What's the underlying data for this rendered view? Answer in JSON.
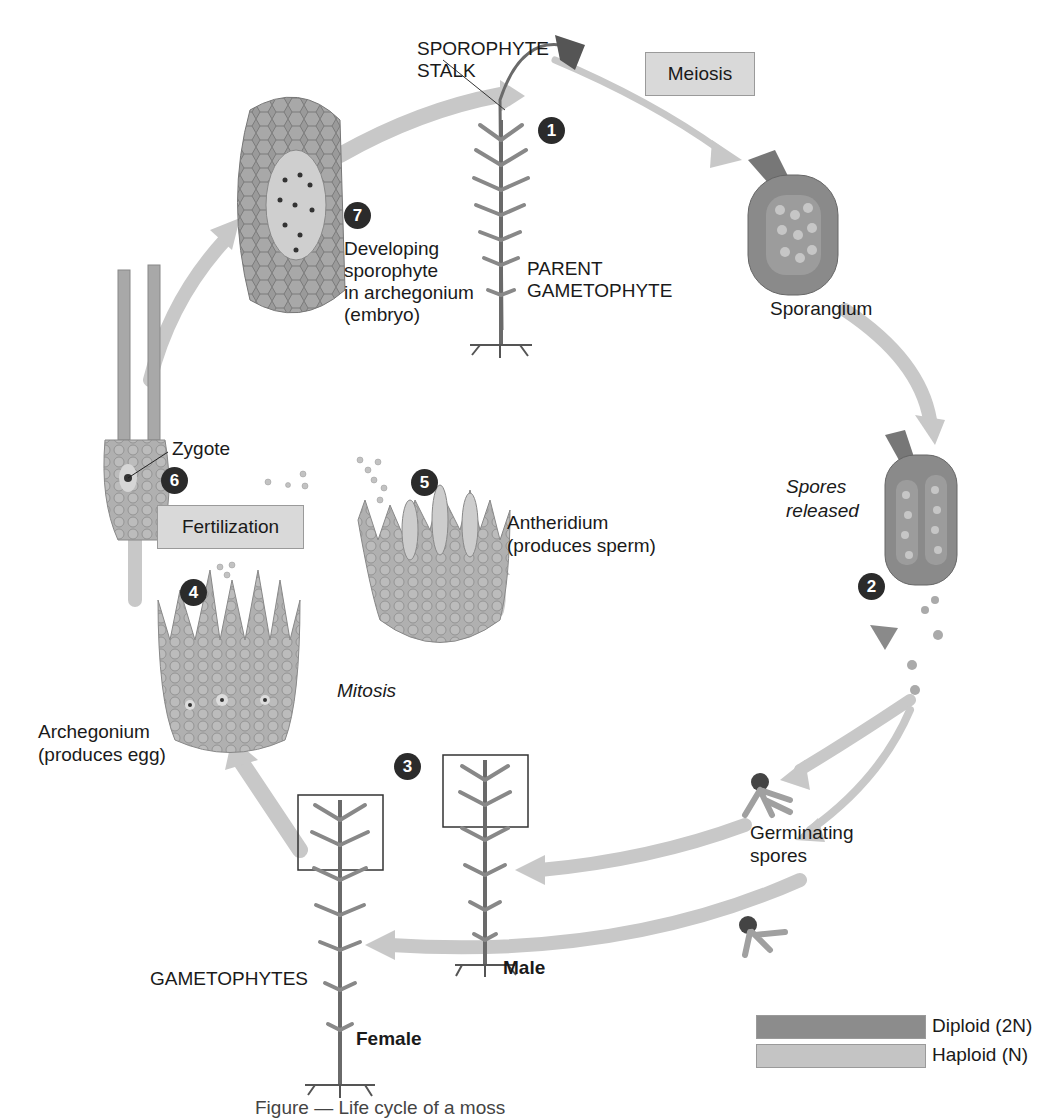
{
  "diagram": {
    "type": "life-cycle",
    "subject": "moss",
    "caption": "Figure — Life cycle of a moss",
    "process_boxes": {
      "meiosis": "Meiosis",
      "fertilization": "Fertilization"
    },
    "italic_labels": {
      "spores_released_1": "Spores",
      "spores_released_2": "released",
      "mitosis": "Mitosis"
    },
    "labels": {
      "sporophyte_stalk_1": "SPOROPHYTE",
      "sporophyte_stalk_2": "STALK",
      "parent_gametophyte_1": "PARENT",
      "parent_gametophyte_2": "GAMETOPHYTE",
      "sporangium": "Sporangium",
      "germinating_spores_1": "Germinating",
      "germinating_spores_2": "spores",
      "developing_1": "Developing",
      "developing_2": "sporophyte",
      "developing_3": "in archegonium",
      "developing_4": "(embryo)",
      "zygote": "Zygote",
      "antheridium_1": "Antheridium",
      "antheridium_2": "(produces sperm)",
      "archegonium_1": "Archegonium",
      "archegonium_2": "(produces egg)",
      "gametophytes": "GAMETOPHYTES",
      "male": "Male",
      "female": "Female"
    },
    "steps": [
      "1",
      "2",
      "3",
      "4",
      "5",
      "6",
      "7"
    ],
    "legend": [
      {
        "label": "Diploid (2N)",
        "color": "#8c8c8c"
      },
      {
        "label": "Haploid (N)",
        "color": "#c4c4c4"
      }
    ],
    "colors": {
      "diploid": "#8c8c8c",
      "haploid": "#c4c4c4",
      "arrow": "#c8c8c8",
      "step_badge": "#2b2b2b",
      "process_box": "#d9d9d9"
    }
  }
}
